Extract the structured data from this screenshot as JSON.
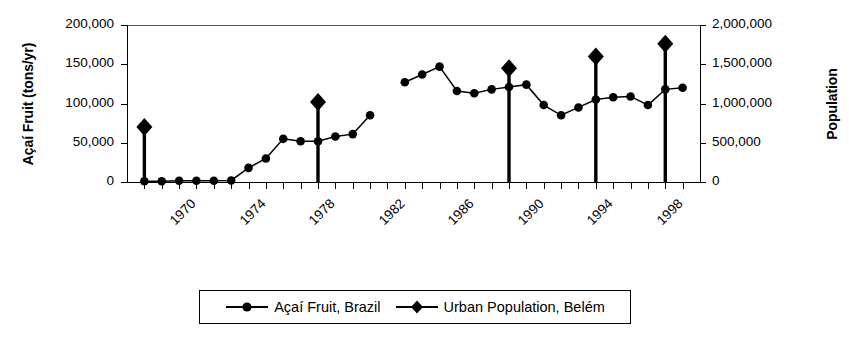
{
  "chart_data": {
    "type": "line",
    "title": "",
    "xlabel": "",
    "ylabel": "Açaí Fruit (tons/yr)",
    "y2label": "Population",
    "xlim": [
      1969,
      2002
    ],
    "ylim": [
      0,
      200000
    ],
    "y2lim": [
      0,
      2000000
    ],
    "grid": false,
    "legend_position": "bottom-center",
    "x_tick_labels": [
      "1970",
      "1974",
      "1978",
      "1982",
      "1986",
      "1990",
      "1994",
      "1998"
    ],
    "x_tick_values": [
      1970,
      1974,
      1978,
      1982,
      1986,
      1990,
      1994,
      1998
    ],
    "y_tick_labels": [
      "0",
      "50,000",
      "100,000",
      "150,000",
      "200,000"
    ],
    "y_tick_values": [
      0,
      50000,
      100000,
      150000,
      200000
    ],
    "y2_tick_labels": [
      "0",
      "500,000",
      "1,000,000",
      "1,500,000",
      "2,000,000"
    ],
    "y2_tick_values": [
      0,
      500000,
      1000000,
      1500000,
      2000000
    ],
    "series": [
      {
        "name": "Açaí Fruit, Brazil",
        "marker": "circle",
        "axis": "left",
        "units": "tons/yr",
        "x": [
          1970,
          1971,
          1972,
          1973,
          1974,
          1975,
          1976,
          1977,
          1978,
          1979,
          1980,
          1981,
          1982,
          1983,
          1985,
          1986,
          1987,
          1988,
          1989,
          1990,
          1991,
          1992,
          1993,
          1994,
          1995,
          1996,
          1997,
          1998,
          1999,
          2000,
          2001
        ],
        "values": [
          1000,
          1000,
          1500,
          1500,
          1500,
          2000,
          18000,
          30000,
          55000,
          52000,
          52000,
          58000,
          61000,
          85000,
          127000,
          137000,
          147000,
          116000,
          113000,
          118000,
          121000,
          124000,
          98000,
          85000,
          95000,
          105000,
          108000,
          109000,
          98000,
          118000,
          120000
        ]
      },
      {
        "name": "Urban Population, Belém",
        "marker": "diamond",
        "axis": "right",
        "units": "people",
        "x": [
          1970,
          1980,
          1991,
          1996,
          2000
        ],
        "values": [
          700000,
          1020000,
          1450000,
          1600000,
          1760000
        ]
      }
    ]
  },
  "legend": {
    "entries": [
      {
        "label": "Açaí Fruit, Brazil",
        "marker": "circle-marker"
      },
      {
        "label": "Urban Population, Belém",
        "marker": "diamond-marker"
      }
    ]
  }
}
